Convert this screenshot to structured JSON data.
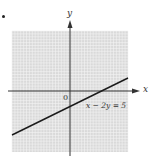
{
  "chart_data": {
    "type": "line",
    "title": "",
    "xlabel": "x",
    "ylabel": "y",
    "origin_label": "0",
    "grid": true,
    "xlim": [
      -10,
      10
    ],
    "ylim": [
      -10,
      10
    ],
    "series": [
      {
        "name": "x - 2y = 5",
        "equation": "x - 2y = 5",
        "x": [
          -10,
          10
        ],
        "values": [
          -7.5,
          2.5
        ]
      }
    ],
    "annotations": [
      "x − 2y = 5"
    ]
  },
  "labels": {
    "x_axis": "x",
    "y_axis": "y",
    "origin": "0",
    "equation": "x − 2y = 5"
  },
  "colors": {
    "grid_background": "#d9d9d9",
    "grid_lines": "#f4f4f4",
    "axes": "#333333",
    "line": "#1a1a1a"
  }
}
